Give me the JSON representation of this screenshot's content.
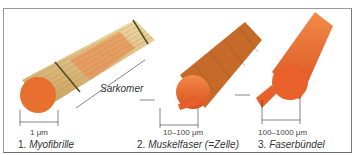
{
  "figure": {
    "panels": [
      {
        "number": "1.",
        "name": "Myofibrille",
        "dimension": "1 μm"
      },
      {
        "number": "2.",
        "name": "Muskelfaser (=Zelle)",
        "dimension": "10–100 μm"
      },
      {
        "number": "3.",
        "name": "Faserbündel",
        "dimension": "100–1000 μm"
      }
    ],
    "annotation": "Sarkomer",
    "colors": {
      "fiber_orange": "#e8602a",
      "fibril_tan": "#d9b77a",
      "band_dark": "#4a4a2a",
      "frame": "#8a8a8a"
    }
  }
}
